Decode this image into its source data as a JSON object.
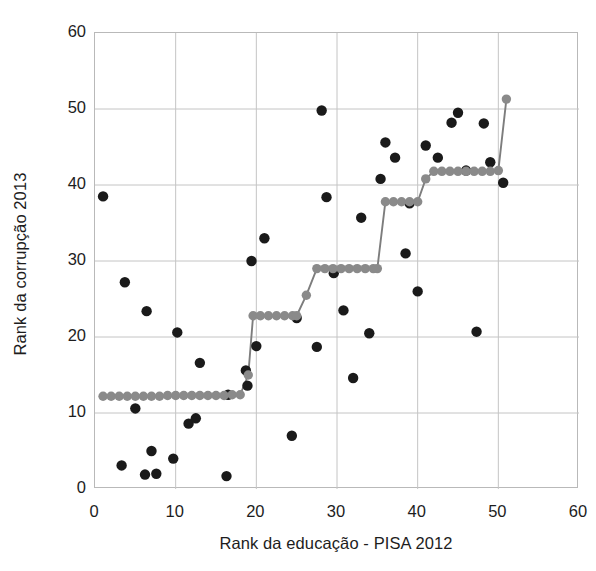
{
  "chart_data": {
    "type": "scatter",
    "title": "",
    "xlabel": "Rank da educação - PISA 2012",
    "ylabel": "Rank da corrupção 2013",
    "xlim": [
      0,
      60
    ],
    "ylim": [
      0,
      60
    ],
    "xticks": [
      0,
      10,
      20,
      30,
      40,
      50,
      60
    ],
    "yticks": [
      0,
      10,
      20,
      30,
      40,
      50,
      60
    ],
    "grid": true,
    "legend": "none",
    "colors": {
      "observed_points": "#1a1a1a",
      "fitted_points": "#8a8a8a",
      "fitted_line": "#7d7d7d",
      "gridline": "#c4c4c4",
      "axis_border": "#b0b0b0",
      "background": "#ffffff",
      "text": "#1d1d1d"
    },
    "series": [
      {
        "name": "observed",
        "marker": "filled-circle",
        "color": "#1a1a1a",
        "points": [
          [
            1.0,
            38.5
          ],
          [
            3.3,
            3.1
          ],
          [
            3.7,
            27.2
          ],
          [
            5.0,
            10.6
          ],
          [
            6.2,
            1.9
          ],
          [
            6.4,
            23.4
          ],
          [
            7.0,
            5.0
          ],
          [
            7.6,
            2.0
          ],
          [
            9.7,
            4.0
          ],
          [
            10.2,
            20.6
          ],
          [
            11.6,
            8.6
          ],
          [
            12.5,
            9.3
          ],
          [
            13.0,
            16.6
          ],
          [
            16.3,
            1.7
          ],
          [
            16.5,
            12.4
          ],
          [
            18.7,
            15.6
          ],
          [
            18.9,
            13.6
          ],
          [
            19.4,
            30.0
          ],
          [
            20.0,
            18.8
          ],
          [
            21.0,
            33.0
          ],
          [
            24.4,
            7.0
          ],
          [
            25.0,
            22.5
          ],
          [
            27.5,
            18.7
          ],
          [
            28.1,
            49.8
          ],
          [
            28.7,
            38.4
          ],
          [
            29.6,
            28.4
          ],
          [
            30.8,
            23.5
          ],
          [
            32.0,
            14.6
          ],
          [
            33.0,
            35.7
          ],
          [
            34.0,
            20.5
          ],
          [
            35.4,
            40.8
          ],
          [
            36.0,
            45.6
          ],
          [
            37.2,
            43.6
          ],
          [
            38.5,
            31.0
          ],
          [
            39.0,
            37.6
          ],
          [
            40.0,
            26.0
          ],
          [
            41.0,
            45.2
          ],
          [
            42.5,
            43.6
          ],
          [
            44.2,
            48.2
          ],
          [
            45.0,
            49.5
          ],
          [
            46.0,
            41.9
          ],
          [
            47.3,
            20.7
          ],
          [
            48.2,
            48.1
          ],
          [
            49.0,
            43.0
          ],
          [
            50.6,
            40.3
          ]
        ]
      },
      {
        "name": "ajuste (fitted step curve)",
        "marker": "filled-circle",
        "color": "#8a8a8a",
        "line": true,
        "points": [
          [
            1.0,
            12.2
          ],
          [
            2.0,
            12.2
          ],
          [
            3.0,
            12.2
          ],
          [
            4.0,
            12.2
          ],
          [
            5.0,
            12.2
          ],
          [
            6.0,
            12.2
          ],
          [
            7.0,
            12.2
          ],
          [
            8.0,
            12.2
          ],
          [
            9.0,
            12.3
          ],
          [
            10.0,
            12.3
          ],
          [
            11.0,
            12.3
          ],
          [
            12.0,
            12.3
          ],
          [
            13.0,
            12.3
          ],
          [
            14.0,
            12.3
          ],
          [
            15.0,
            12.3
          ],
          [
            16.0,
            12.3
          ],
          [
            17.0,
            12.4
          ],
          [
            18.0,
            12.4
          ],
          [
            19.0,
            15.0
          ],
          [
            19.6,
            22.8
          ],
          [
            20.5,
            22.8
          ],
          [
            21.5,
            22.8
          ],
          [
            22.5,
            22.8
          ],
          [
            23.5,
            22.8
          ],
          [
            24.5,
            22.8
          ],
          [
            25.0,
            22.8
          ],
          [
            26.2,
            25.5
          ],
          [
            27.5,
            29.0
          ],
          [
            28.5,
            29.0
          ],
          [
            29.5,
            29.0
          ],
          [
            30.5,
            29.0
          ],
          [
            31.5,
            29.0
          ],
          [
            32.5,
            29.0
          ],
          [
            33.5,
            29.0
          ],
          [
            34.5,
            29.0
          ],
          [
            35.0,
            29.0
          ],
          [
            36.0,
            37.8
          ],
          [
            37.0,
            37.8
          ],
          [
            38.0,
            37.8
          ],
          [
            39.0,
            37.8
          ],
          [
            40.0,
            37.8
          ],
          [
            41.0,
            40.8
          ],
          [
            42.0,
            41.8
          ],
          [
            43.0,
            41.8
          ],
          [
            44.0,
            41.8
          ],
          [
            45.0,
            41.8
          ],
          [
            46.0,
            41.8
          ],
          [
            47.0,
            41.8
          ],
          [
            48.0,
            41.8
          ],
          [
            49.0,
            41.8
          ],
          [
            50.0,
            41.9
          ],
          [
            51.0,
            51.3
          ]
        ]
      }
    ]
  }
}
